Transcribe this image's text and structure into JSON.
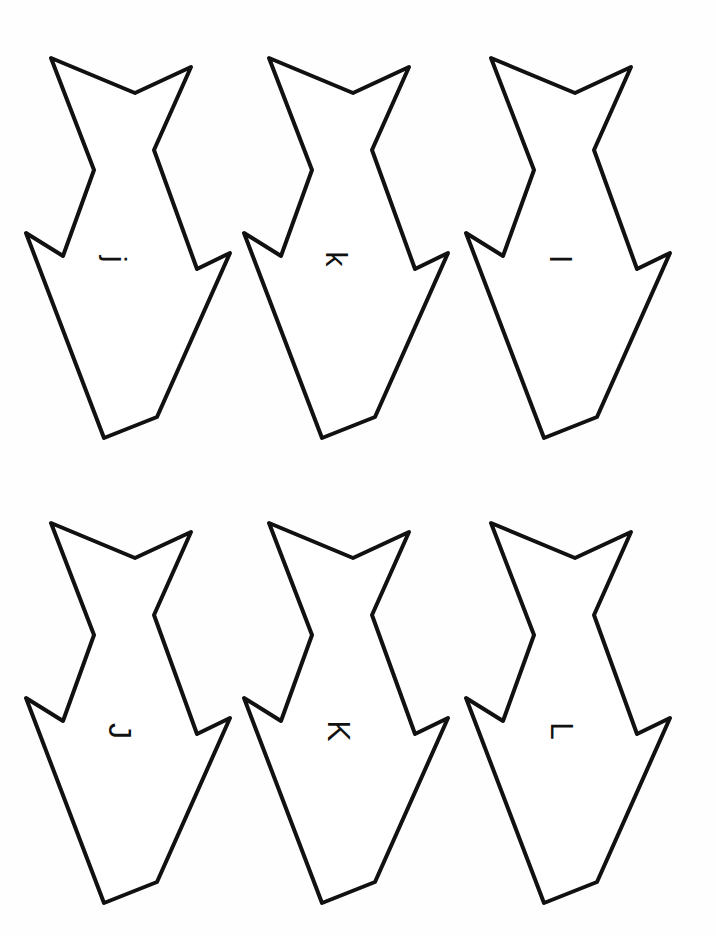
{
  "page": {
    "background": "#fefefe",
    "stroke_color": "#111111"
  },
  "fish": [
    {
      "id": "fish-1",
      "row": 1,
      "col": 1,
      "letter": "j",
      "case": "lowercase",
      "offset": [
        0,
        0
      ]
    },
    {
      "id": "fish-2",
      "row": 1,
      "col": 2,
      "letter": "k",
      "case": "lowercase",
      "offset": [
        218,
        0
      ]
    },
    {
      "id": "fish-3",
      "row": 1,
      "col": 3,
      "letter": "l",
      "case": "lowercase",
      "offset": [
        440,
        0
      ]
    },
    {
      "id": "fish-4",
      "row": 2,
      "col": 1,
      "letter": "J",
      "case": "uppercase",
      "offset": [
        0,
        465
      ]
    },
    {
      "id": "fish-5",
      "row": 2,
      "col": 2,
      "letter": "K",
      "case": "uppercase",
      "offset": [
        218,
        465
      ]
    },
    {
      "id": "fish-6",
      "row": 2,
      "col": 3,
      "letter": "L",
      "case": "uppercase",
      "offset": [
        440,
        465
      ]
    }
  ],
  "letter_rotation_deg": 90
}
